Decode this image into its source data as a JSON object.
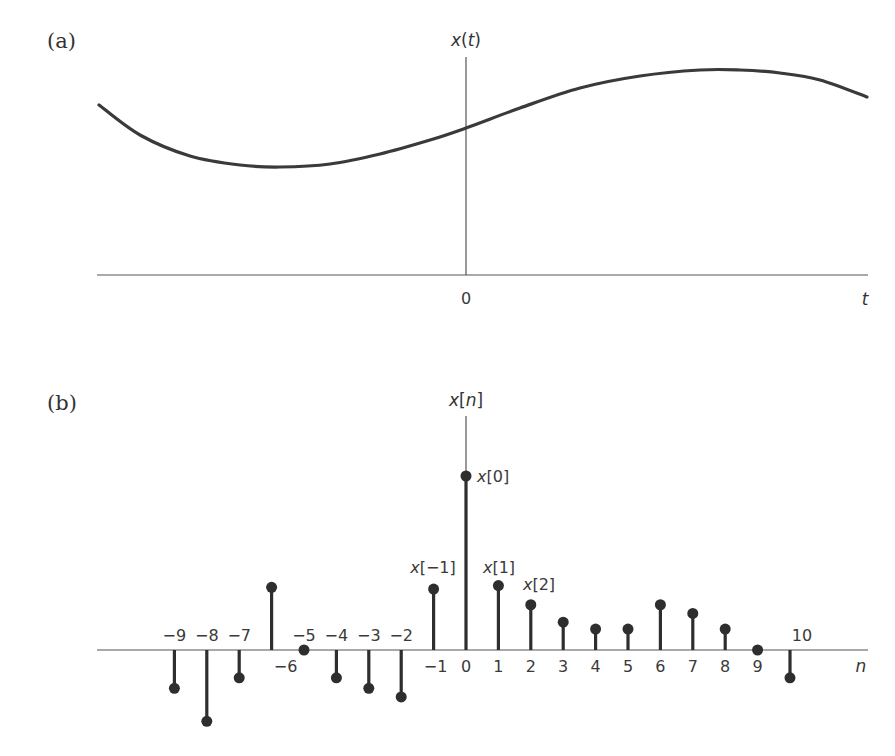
{
  "figure": {
    "panel_a": {
      "label": "(a)",
      "y_axis_label": "x(t)",
      "x_axis_label": "t",
      "origin_label": "0"
    },
    "panel_b": {
      "label": "(b)",
      "y_axis_label": "x[n]",
      "x_axis_label": "n",
      "annotations": [
        "x[0]",
        "x[−1]",
        "x[1]",
        "x[2]"
      ]
    }
  },
  "colors": {
    "ink": "#2e2e2e",
    "axis": "#555555",
    "background": "#ffffff"
  },
  "chart_data": [
    {
      "type": "line",
      "title": "(a)",
      "xlabel": "t",
      "ylabel": "x(t)",
      "description": "Continuous-time signal x(t): smooth curve decreasing to a minimum left of origin, rising through t=0, peaking to the right, then decreasing.",
      "x_ticks": [
        "0"
      ],
      "grid": false,
      "points_px": [
        [
          99,
          105
        ],
        [
          140,
          135
        ],
        [
          190,
          156
        ],
        [
          240,
          165
        ],
        [
          280,
          167
        ],
        [
          330,
          164
        ],
        [
          380,
          154
        ],
        [
          430,
          140
        ],
        [
          466,
          128
        ],
        [
          520,
          108
        ],
        [
          580,
          88
        ],
        [
          640,
          76
        ],
        [
          700,
          70
        ],
        [
          740,
          70
        ],
        [
          780,
          73
        ],
        [
          820,
          80
        ],
        [
          867,
          97
        ]
      ]
    },
    {
      "type": "stem",
      "title": "(b)",
      "xlabel": "n",
      "ylabel": "x[n]",
      "grid": false,
      "x": [
        -9,
        -8,
        -7,
        -6,
        -5,
        -4,
        -3,
        -2,
        -1,
        0,
        1,
        2,
        3,
        4,
        5,
        6,
        7,
        8,
        9,
        10
      ],
      "tick_labels": [
        "−9",
        "−8",
        "−7",
        "−6",
        "−5",
        "−4",
        "−3",
        "−2",
        "−1",
        "0",
        "1",
        "2",
        "3",
        "4",
        "5",
        "6",
        "7",
        "8",
        "9",
        "10"
      ],
      "values": [
        -0.22,
        -0.41,
        -0.16,
        0.36,
        0.0,
        -0.16,
        -0.22,
        -0.27,
        0.35,
        1.0,
        0.37,
        0.26,
        0.16,
        0.12,
        0.12,
        0.26,
        0.21,
        0.12,
        0.0,
        -0.16
      ],
      "annotated_points": {
        "0": "x[0]",
        "-1": "x[−1]",
        "1": "x[1]",
        "2": "x[2]"
      },
      "ylim": [
        -0.5,
        1.2
      ]
    }
  ]
}
